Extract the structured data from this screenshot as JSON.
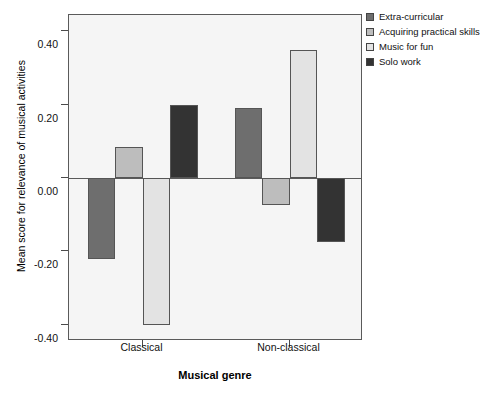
{
  "chart_data": {
    "type": "bar",
    "title": "",
    "xlabel": "Musical genre",
    "ylabel": "Mean score for relevance of musical activities",
    "categories": [
      "Classical",
      "Non-classical"
    ],
    "series": [
      {
        "name": "Extra-curricular",
        "color": "#6e6e6e",
        "values": [
          -0.22,
          0.19
        ]
      },
      {
        "name": "Acquiring practical skills",
        "color": "#bdbdbd",
        "values": [
          0.085,
          -0.075
        ]
      },
      {
        "name": "Music for fun",
        "color": "#e3e3e3",
        "values": [
          -0.4,
          0.35
        ]
      },
      {
        "name": "Solo work",
        "color": "#333333",
        "values": [
          0.2,
          -0.175
        ]
      }
    ],
    "ylim": [
      -0.445,
      0.445
    ],
    "yticks": [
      0.4,
      0.2,
      0.0,
      -0.2,
      -0.4
    ],
    "ytick_labels": [
      "0.40",
      "0.20",
      "0.00",
      "-0.20",
      "-0.40"
    ],
    "grid": false,
    "zero_line": true,
    "legend_position": "right"
  },
  "axes": {
    "y_title": "Mean score for relevance of musical activities",
    "x_title": "Musical genre"
  }
}
